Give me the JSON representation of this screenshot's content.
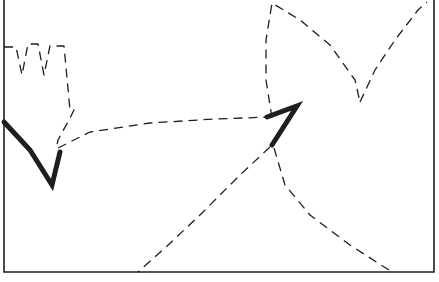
{
  "diagram": {
    "type": "movement-path-diagram",
    "background": "#ffffff",
    "stroke_color": "#1e1e1e",
    "frame": {
      "left": 4,
      "top": 0,
      "right": 434,
      "bottom": 272
    },
    "dashed_paths": [
      {
        "id": "crown-outline",
        "points": "4,47 16,47 22,75 28,44 38,44 44,75 50,46 64,46 70,110 74,110 70,118 58,140 56,150"
      },
      {
        "id": "left-to-center-curve",
        "points": "58,148 90,132 150,123 215,119 270,117"
      },
      {
        "id": "upper-left-arc",
        "points": "272,118 266,80 266,40 272,3 300,20 330,45 355,80 360,102"
      },
      {
        "id": "upper-right-arc",
        "points": "360,102 375,70 395,40 418,10 427,2"
      },
      {
        "id": "lower-left-arc",
        "points": "270,147 240,175 200,215 165,248 138,272"
      },
      {
        "id": "lower-right-arc",
        "points": "274,148 285,185 310,215 350,245 392,272"
      }
    ],
    "solid_marks": [
      {
        "id": "left-heavy-stroke",
        "points": "4,122 30,150 52,185 60,152"
      },
      {
        "id": "center-heavy-stroke",
        "points": "267,117 297,106 272,145"
      }
    ]
  }
}
